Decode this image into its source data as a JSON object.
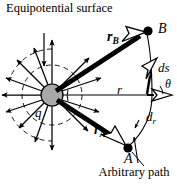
{
  "figure": {
    "title_annotation": "Equipotential surface",
    "path_annotation": "Arbitrary path",
    "labels": {
      "charge": "q",
      "point_b": "B",
      "point_a": "A",
      "vector_rb_symbol": "r",
      "vector_rb_sub": "B",
      "vector_ra_symbol": "r",
      "vector_ra_sub": "A",
      "radial_r": "r",
      "arc_length_element": "ds",
      "radial_element_symbol": "d",
      "radial_element_sub": "r",
      "angle": "θ"
    },
    "colors": {
      "stroke": "#000000",
      "charge_fill": "#a8a8a8",
      "background": "#ffffff"
    },
    "geometry": {
      "charge_center_x": 52,
      "charge_center_y": 95,
      "charge_radius": 11,
      "point_b_x": 148,
      "point_b_y": 31,
      "point_a_x": 128,
      "point_a_y": 148,
      "field_line_count": 12,
      "equipotential_arcs": 2,
      "path_description": "thin curve bulging rightward from A up to B"
    }
  }
}
